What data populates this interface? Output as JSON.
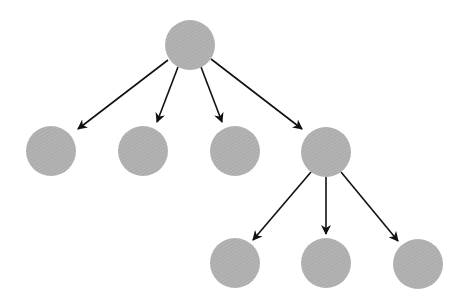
{
  "diagram": {
    "type": "tree",
    "colors": {
      "node_fill": "#b0b0b0",
      "node_hatch": "#9c9c9c",
      "edge": "#111111",
      "background": "#ffffff"
    },
    "node_radius": 25,
    "nodes": [
      {
        "id": "root",
        "cx": 190,
        "cy": 45
      },
      {
        "id": "child-1",
        "cx": 51,
        "cy": 151
      },
      {
        "id": "child-2",
        "cx": 143,
        "cy": 151
      },
      {
        "id": "child-3",
        "cx": 235,
        "cy": 151
      },
      {
        "id": "child-4",
        "cx": 326,
        "cy": 152
      },
      {
        "id": "grandchild-1",
        "cx": 235,
        "cy": 263
      },
      {
        "id": "grandchild-2",
        "cx": 326,
        "cy": 263
      },
      {
        "id": "grandchild-3",
        "cx": 418,
        "cy": 264
      }
    ],
    "edges": [
      {
        "from": "root",
        "to": "child-1",
        "x1": 168,
        "y1": 60,
        "x2": 78,
        "y2": 129
      },
      {
        "from": "root",
        "to": "child-2",
        "x1": 178,
        "y1": 67,
        "x2": 157,
        "y2": 122
      },
      {
        "from": "root",
        "to": "child-3",
        "x1": 201,
        "y1": 67,
        "x2": 222,
        "y2": 122
      },
      {
        "from": "root",
        "to": "child-4",
        "x1": 211,
        "y1": 59,
        "x2": 302,
        "y2": 129
      },
      {
        "from": "child-4",
        "to": "grandchild-1",
        "x1": 311,
        "y1": 172,
        "x2": 253,
        "y2": 240
      },
      {
        "from": "child-4",
        "to": "grandchild-2",
        "x1": 326,
        "y1": 177,
        "x2": 326,
        "y2": 234
      },
      {
        "from": "child-4",
        "to": "grandchild-3",
        "x1": 341,
        "y1": 172,
        "x2": 398,
        "y2": 241
      }
    ]
  }
}
